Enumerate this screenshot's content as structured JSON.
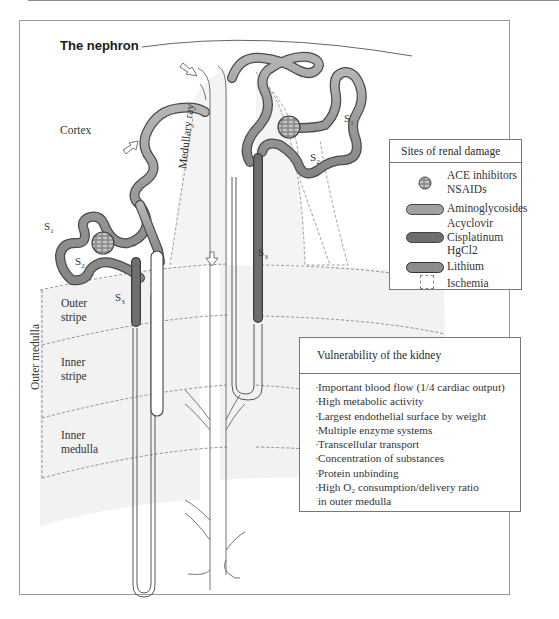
{
  "title": "The nephron",
  "zones": {
    "cortex": "Cortex",
    "medullary_ray": "Medullary ray",
    "outer_stripe": [
      "Outer",
      "stripe"
    ],
    "inner_stripe": [
      "Inner",
      "stripe"
    ],
    "inner_medulla": [
      "Inner",
      "medulla"
    ],
    "outer_medulla": "Outer medulla"
  },
  "segments": {
    "left_s1": "S",
    "left_s1_sub": "1",
    "left_s2": "S",
    "left_s2_sub": "2",
    "left_s3": "S",
    "left_s3_sub": "3",
    "right_s1": "S",
    "right_s1_sub": "1",
    "right_s2": "S",
    "right_s2_sub": "2",
    "right_s3": "S",
    "right_s3_sub": "3"
  },
  "legend": {
    "title": "Sites of renal damage",
    "items": [
      {
        "symbol": "glomerulus-icon",
        "lines": [
          "ACE inhibitors",
          "NSAIDs"
        ]
      },
      {
        "symbol": "proximal-tubule-pill",
        "lines": [
          "Aminoglycosides"
        ]
      },
      {
        "symbol": "s3-segment-pill",
        "lines": [
          "Acyclovir",
          "Cisplatinum",
          "HgCl2"
        ]
      },
      {
        "symbol": "collecting-duct-pill",
        "lines": [
          "Lithium"
        ]
      },
      {
        "symbol": "dashed-box-icon",
        "lines": [
          "Ischemia"
        ]
      }
    ]
  },
  "vulnerability": {
    "title": "Vulnerability of the kidney",
    "items": [
      "Important blood flow (1/4 cardiac output)",
      "High metabolic activity",
      "Largest endothelial surface by weight",
      "Multiple enzyme systems",
      "Transcellular transport",
      "Concentration of substances",
      "Protein unbinding",
      "High O₂ consumption/delivery ratio",
      "in outer medulla"
    ]
  },
  "colors": {
    "proximal_tubule": "#9a9a9a",
    "s3_segment": "#6e6e6e",
    "lithium": "#8c8c8c",
    "ischemia_zone": "#f1f1f1",
    "frame": "#9a9a9a"
  }
}
